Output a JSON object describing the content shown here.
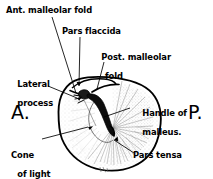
{
  "figure": {
    "background_color": "#ffffff",
    "ink_color": "#000000"
  },
  "labels": {
    "ant_malleolar_fold": "Ant. malleolar fold",
    "pars_flaccida": "Pars flaccida",
    "post_malleolar_fold_line1": "Post. malleolar",
    "post_malleolar_fold_line2": "fold",
    "lateral_process_line1": "Lateral",
    "lateral_process_line2": "process",
    "handle_of_malleus_line1": "Handle of",
    "handle_of_malleus_line2": "malleus.",
    "cone_of_light_line1": "Cone",
    "cone_of_light_line2": "of light",
    "pars_tensa": "Pars tensa"
  },
  "orientation_markers": {
    "anterior": "A.",
    "posterior": "P."
  }
}
